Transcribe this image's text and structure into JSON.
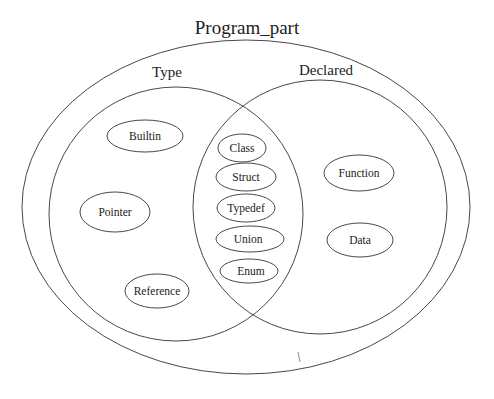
{
  "title": "Program_part",
  "sets": {
    "outer": {
      "label": "Program_part",
      "cx": 246,
      "cy": 207,
      "rx": 224,
      "ry": 167
    },
    "type": {
      "label": "Type",
      "cx": 176,
      "cy": 214,
      "rx": 127,
      "ry": 127
    },
    "declared": {
      "label": "Declared",
      "cx": 320,
      "cy": 207,
      "rx": 127,
      "ry": 127
    }
  },
  "labels": {
    "program_part": "Program_part",
    "type": "Type",
    "declared": "Declared"
  },
  "nodes": [
    {
      "label": "Builtin",
      "set": "Type",
      "cx": 145,
      "cy": 136,
      "rx": 38,
      "ry": 16
    },
    {
      "label": "Pointer",
      "set": "Type",
      "cx": 115,
      "cy": 212,
      "rx": 35,
      "ry": 20
    },
    {
      "label": "Reference",
      "set": "Type",
      "cx": 157,
      "cy": 291,
      "rx": 32,
      "ry": 17
    },
    {
      "label": "Class",
      "set": "Type ∩ Declared",
      "cx": 242,
      "cy": 148,
      "rx": 24,
      "ry": 14
    },
    {
      "label": "Struct",
      "set": "Type ∩ Declared",
      "cx": 246,
      "cy": 177,
      "rx": 30,
      "ry": 14
    },
    {
      "label": "Typedef",
      "set": "Type ∩ Declared",
      "cx": 246,
      "cy": 208,
      "rx": 29,
      "ry": 14
    },
    {
      "label": "Union",
      "set": "Type ∩ Declared",
      "cx": 250,
      "cy": 239,
      "rx": 34,
      "ry": 13
    },
    {
      "label": "Enum",
      "set": "Type ∩ Declared",
      "cx": 249,
      "cy": 271,
      "rx": 29,
      "ry": 12
    },
    {
      "label": "Function",
      "set": "Declared",
      "cx": 359,
      "cy": 173,
      "rx": 35,
      "ry": 18
    },
    {
      "label": "Data",
      "set": "Declared",
      "cx": 360,
      "cy": 240,
      "rx": 33,
      "ry": 17
    }
  ]
}
